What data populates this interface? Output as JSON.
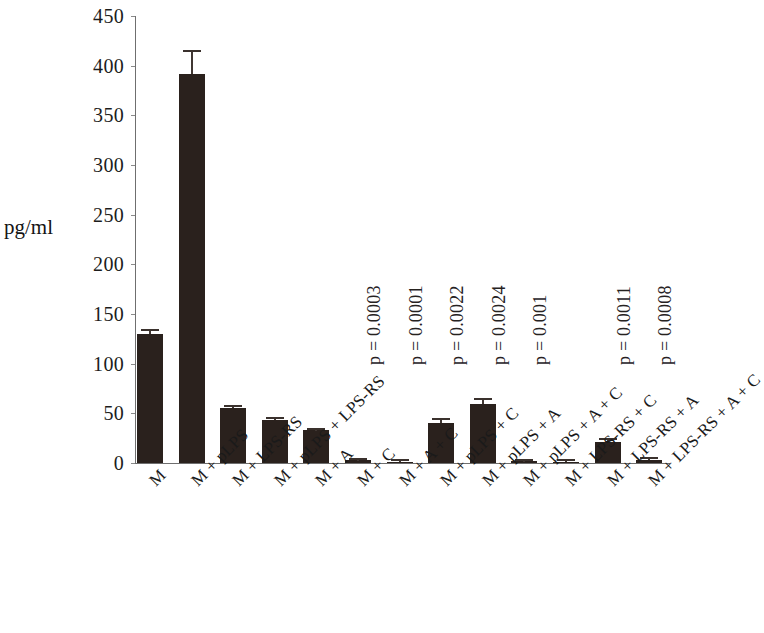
{
  "chart_data": {
    "type": "bar",
    "title": "",
    "subtitle": "",
    "xlabel": "",
    "ylabel": "pg/ml",
    "ylim": [
      0,
      450
    ],
    "yticks": [
      0,
      50,
      100,
      150,
      200,
      250,
      300,
      350,
      400,
      450
    ],
    "ytick_labels": [
      "0",
      "50",
      "100",
      "150",
      "200",
      "250",
      "300",
      "350",
      "400",
      "450"
    ],
    "grid": false,
    "legend": null,
    "bar_color": "#2a211d",
    "categories": [
      "M",
      "M + pLPS",
      "M + LPS-RS",
      "M + pLPS + LPS-RS",
      "M + A",
      "M + C",
      "M + A + C",
      "M + pLPS + C",
      "M + pLPS + A",
      "M + pLPS + A + C",
      "M + LPS-RS + C",
      "M + LPS-RS + A",
      "M + LPS-RS + A + C"
    ],
    "values": [
      130,
      392,
      55,
      43,
      33,
      3,
      1.5,
      40,
      59,
      2,
      1,
      21,
      3
    ],
    "errors": [
      3,
      22,
      1.5,
      1,
      0.5,
      0.5,
      0.5,
      3.5,
      4,
      0.5,
      0.5,
      2,
      0.8
    ],
    "annotations": [
      {
        "bar_index": 5,
        "text": "p = 0.0003"
      },
      {
        "bar_index": 6,
        "text": "p = 0.0001"
      },
      {
        "bar_index": 7,
        "text": "p = 0.0022"
      },
      {
        "bar_index": 8,
        "text": "p = 0.0024"
      },
      {
        "bar_index": 9,
        "text": "p = 0.001"
      },
      {
        "bar_index": 11,
        "text": "p = 0.0011"
      },
      {
        "bar_index": 12,
        "text": "p = 0.0008"
      }
    ]
  }
}
